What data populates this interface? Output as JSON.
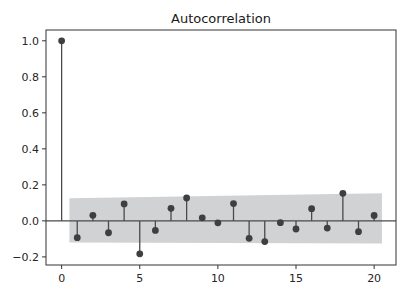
{
  "chart_data": {
    "type": "stem",
    "title": "Autocorrelation",
    "xlabel": "",
    "ylabel": "",
    "xlim": [
      -1.0,
      21.4
    ],
    "ylim": [
      -0.245,
      1.06
    ],
    "x_ticks": [
      0,
      5,
      10,
      15,
      20
    ],
    "x_tick_labels": [
      "0",
      "5",
      "10",
      "15",
      "20"
    ],
    "y_ticks": [
      -0.2,
      0.0,
      0.2,
      0.4,
      0.6,
      0.8,
      1.0
    ],
    "y_tick_labels": [
      "−0.2",
      "0.0",
      "0.2",
      "0.4",
      "0.6",
      "0.8",
      "1.0"
    ],
    "grid": false,
    "lags": [
      0,
      1,
      2,
      3,
      4,
      5,
      6,
      7,
      8,
      9,
      10,
      11,
      12,
      13,
      14,
      15,
      16,
      17,
      18,
      19,
      20
    ],
    "acf": [
      1.0,
      -0.093,
      0.031,
      -0.066,
      0.094,
      -0.183,
      -0.053,
      0.07,
      0.127,
      0.017,
      -0.011,
      0.096,
      -0.097,
      -0.115,
      -0.01,
      -0.045,
      0.068,
      -0.04,
      0.153,
      -0.06,
      0.03
    ],
    "confidence_band": {
      "x_start": 0.5,
      "x_end": 20.5,
      "upper": [
        0.125,
        0.153
      ],
      "lower": [
        -0.12,
        -0.125
      ]
    },
    "colors": {
      "stem": "#4a4a4a",
      "marker": "#3f3f3f",
      "band": "#d0d2d4",
      "zero_line": "#4a4a4a",
      "axes": "#333333"
    }
  }
}
